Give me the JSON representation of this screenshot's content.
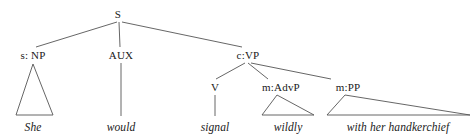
{
  "diagram": {
    "type": "syntax-tree",
    "title": "",
    "sentence": "She would signal wildly with her handkerchief",
    "line_color": "#555555",
    "text_color": "#1a1a1a",
    "background": "#ffffff",
    "nodes": [
      {
        "id": "s",
        "label": "S",
        "x": 118,
        "y": 14,
        "kind": "root"
      },
      {
        "id": "np",
        "label": "s: NP",
        "x": 33,
        "y": 55,
        "kind": "phrase"
      },
      {
        "id": "aux",
        "label": "AUX",
        "x": 121,
        "y": 55,
        "kind": "phrase"
      },
      {
        "id": "vp",
        "label": "c:VP",
        "x": 248,
        "y": 55,
        "kind": "phrase"
      },
      {
        "id": "v",
        "label": "V",
        "x": 215,
        "y": 87,
        "kind": "phrase"
      },
      {
        "id": "advp",
        "label": "m:AdvP",
        "x": 281,
        "y": 87,
        "kind": "phrase"
      },
      {
        "id": "pp",
        "label": "m:PP",
        "x": 348,
        "y": 87,
        "kind": "phrase"
      }
    ],
    "terminals": [
      {
        "id": "she",
        "label": "She",
        "x": 33,
        "y": 127
      },
      {
        "id": "would",
        "label": "would",
        "x": 121,
        "y": 127
      },
      {
        "id": "signal",
        "label": "signal",
        "x": 215,
        "y": 127
      },
      {
        "id": "wildly",
        "label": "wildly",
        "x": 288,
        "y": 127
      },
      {
        "id": "with",
        "label": "with her handkerchief",
        "x": 398,
        "y": 127
      }
    ],
    "edges": [
      {
        "from": "s",
        "to": "np",
        "x1": 117,
        "y1": 22,
        "x2": 36,
        "y2": 47
      },
      {
        "from": "s",
        "to": "aux",
        "x1": 119,
        "y1": 22,
        "x2": 120,
        "y2": 47
      },
      {
        "from": "s",
        "to": "vp",
        "x1": 122,
        "y1": 22,
        "x2": 242,
        "y2": 47
      },
      {
        "from": "vp",
        "to": "v",
        "x1": 245,
        "y1": 63,
        "x2": 216,
        "y2": 79
      },
      {
        "from": "vp",
        "to": "advp",
        "x1": 248,
        "y1": 63,
        "x2": 268,
        "y2": 79
      },
      {
        "from": "vp",
        "to": "pp",
        "x1": 251,
        "y1": 63,
        "x2": 331,
        "y2": 79
      },
      {
        "from": "aux",
        "to": "would",
        "x1": 121,
        "y1": 63,
        "x2": 121,
        "y2": 116
      },
      {
        "from": "v",
        "to": "signal",
        "x1": 215,
        "y1": 95,
        "x2": 215,
        "y2": 116
      }
    ],
    "triangles": [
      {
        "id": "np-triangle",
        "apex_x": 33,
        "apex_y": 64,
        "left_x": 16,
        "right_x": 53,
        "base_y": 115
      },
      {
        "id": "advp-triangle",
        "apex_x": 277,
        "apex_y": 95,
        "left_x": 262,
        "right_x": 314,
        "base_y": 115
      },
      {
        "id": "pp-triangle",
        "apex_x": 345,
        "apex_y": 95,
        "left_x": 327,
        "right_x": 470,
        "base_y": 115
      }
    ]
  }
}
